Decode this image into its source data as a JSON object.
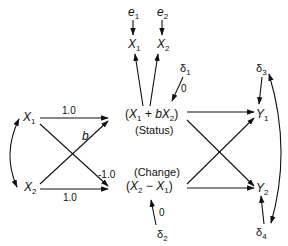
{
  "nodes": {
    "e1": {
      "base": "e",
      "sub": "1"
    },
    "e2": {
      "base": "e",
      "sub": "2"
    },
    "x1_top": {
      "base": "X",
      "sub": "1"
    },
    "x2_top": {
      "base": "X",
      "sub": "2"
    },
    "d1": {
      "base": "δ",
      "sub": "1"
    },
    "d2": {
      "base": "δ",
      "sub": "2"
    },
    "d3": {
      "base": "δ",
      "sub": "3"
    },
    "d4": {
      "base": "δ",
      "sub": "4"
    },
    "x1_left": {
      "base": "X",
      "sub": "1"
    },
    "x2_left": {
      "base": "X",
      "sub": "2"
    },
    "y1": {
      "base": "Y",
      "sub": "1"
    },
    "y2": {
      "base": "Y",
      "sub": "2"
    },
    "status": {
      "expr_open": "(",
      "a": "X",
      "a_sub": "1",
      "op": " + b",
      "b": "X",
      "b_sub": "2",
      "expr_close": ")",
      "label": "(Status)"
    },
    "change": {
      "label": "(Change)",
      "expr_open": "(",
      "a": "X",
      "a_sub": "2",
      "op": " − ",
      "b": "X",
      "b_sub": "1",
      "expr_close": ")"
    }
  },
  "coefficients": {
    "x1_status": "1.0",
    "x2_status": "b",
    "x1_change": "-1.0",
    "x2_change": "1.0",
    "d1_status": "0",
    "d2_change": "0"
  },
  "colors": {
    "stroke": "#111111",
    "background": "#ffffff"
  }
}
